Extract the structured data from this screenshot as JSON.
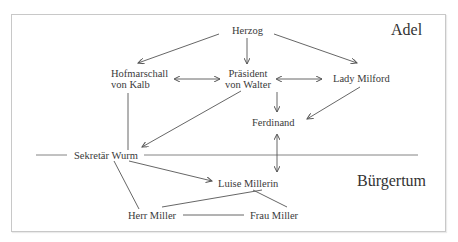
{
  "diagram": {
    "zones": {
      "upper": "Adel",
      "lower": "Bürgertum"
    },
    "nodes": {
      "herzog": "Herzog",
      "hofmarschall_line1": "Hofmarschall",
      "hofmarschall_line2": "von Kalb",
      "praesident_line1": "Präsident",
      "praesident_line2": "von Walter",
      "lady": "Lady Milford",
      "ferdinand": "Ferdinand",
      "wurm": "Sekretär Wurm",
      "luise": "Luise Millerin",
      "herr_miller": "Herr Miller",
      "frau_miller": "Frau Miller"
    },
    "edges": [
      {
        "from": "Herzog",
        "to": "Hofmarschall von Kalb",
        "type": "arrow"
      },
      {
        "from": "Herzog",
        "to": "Präsident von Walter",
        "type": "arrow"
      },
      {
        "from": "Herzog",
        "to": "Lady Milford",
        "type": "arrow"
      },
      {
        "from": "Hofmarschall von Kalb",
        "to": "Präsident von Walter",
        "type": "double-arrow"
      },
      {
        "from": "Präsident von Walter",
        "to": "Lady Milford",
        "type": "double-arrow"
      },
      {
        "from": "Präsident von Walter",
        "to": "Ferdinand",
        "type": "arrow"
      },
      {
        "from": "Präsident von Walter",
        "to": "Sekretär Wurm",
        "type": "arrow"
      },
      {
        "from": "Lady Milford",
        "to": "Ferdinand",
        "type": "arrow"
      },
      {
        "from": "Hofmarschall von Kalb",
        "to": "Sekretär Wurm",
        "type": "line"
      },
      {
        "from": "Ferdinand",
        "to": "Luise Millerin",
        "type": "double-arrow"
      },
      {
        "from": "Sekretär Wurm",
        "to": "Luise Millerin",
        "type": "arrow"
      },
      {
        "from": "Sekretär Wurm",
        "to": "Herr Miller",
        "type": "line"
      },
      {
        "from": "Luise Millerin",
        "to": "Herr Miller",
        "type": "line"
      },
      {
        "from": "Luise Millerin",
        "to": "Frau Miller",
        "type": "line"
      },
      {
        "from": "Herr Miller",
        "to": "Frau Miller",
        "type": "line"
      }
    ],
    "colors": {
      "line": "#555555",
      "text": "#3a3a3a",
      "border": "#c8c8c8",
      "divider": "#777777"
    }
  }
}
